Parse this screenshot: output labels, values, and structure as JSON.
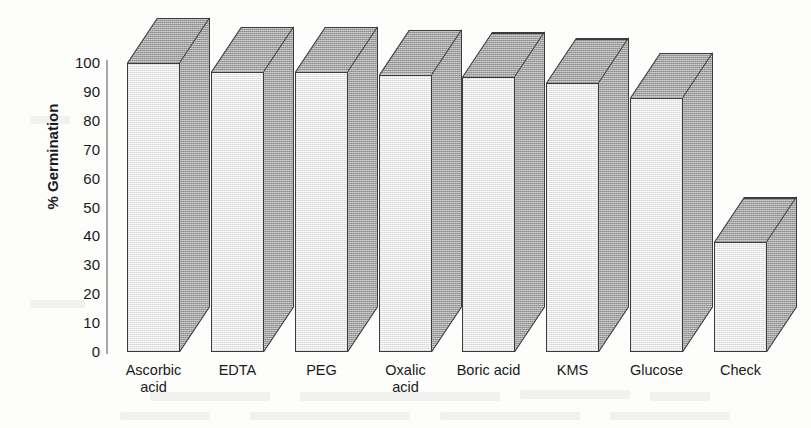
{
  "chart_data": {
    "type": "bar",
    "title": "",
    "subtitle": "",
    "xlabel": "",
    "ylabel": "% Germination",
    "categories": [
      "Ascorbic acid",
      "EDTA",
      "PEG",
      "Oxalic acid",
      "Boric acid",
      "KMS",
      "Glucose",
      "Check"
    ],
    "values": [
      100,
      97,
      97,
      96,
      95,
      93,
      88,
      38
    ],
    "ylim": [
      0,
      100
    ],
    "yticks": [
      0,
      10,
      20,
      30,
      40,
      50,
      60,
      70,
      80,
      90,
      100
    ],
    "ytick_labels": [
      "0",
      "10",
      "20",
      "30",
      "40",
      "50",
      "60",
      "70",
      "80",
      "90",
      "100"
    ],
    "grid": false,
    "legend": false,
    "legend_position": "none",
    "style": "3d-isometric-bar",
    "bar_front_color": "#d3d3d3",
    "bar_side_color": "#a0a0a0",
    "bar_outline_color": "#3c3c3c",
    "axis_color": "#a8a8a8",
    "background_color": "#fdfdfc",
    "series": [
      {
        "name": "% Germination",
        "values": [
          100,
          97,
          97,
          96,
          95,
          93,
          88,
          38
        ]
      }
    ],
    "points": [
      {
        "category": "Ascorbic acid",
        "label_line1": "Ascorbic",
        "label_line2": "acid",
        "value": 100
      },
      {
        "category": "EDTA",
        "label_line1": "EDTA",
        "label_line2": "",
        "value": 97
      },
      {
        "category": "PEG",
        "label_line1": "PEG",
        "label_line2": "",
        "value": 97
      },
      {
        "category": "Oxalic acid",
        "label_line1": "Oxalic",
        "label_line2": "acid",
        "value": 96
      },
      {
        "category": "Boric acid",
        "label_line1": "Boric acid",
        "label_line2": "",
        "value": 95
      },
      {
        "category": "KMS",
        "label_line1": "KMS",
        "label_line2": "",
        "value": 93
      },
      {
        "category": "Glucose",
        "label_line1": "Glucose",
        "label_line2": "",
        "value": 88
      },
      {
        "category": "Check",
        "label_line1": "Check",
        "label_line2": "",
        "value": 38
      }
    ]
  }
}
